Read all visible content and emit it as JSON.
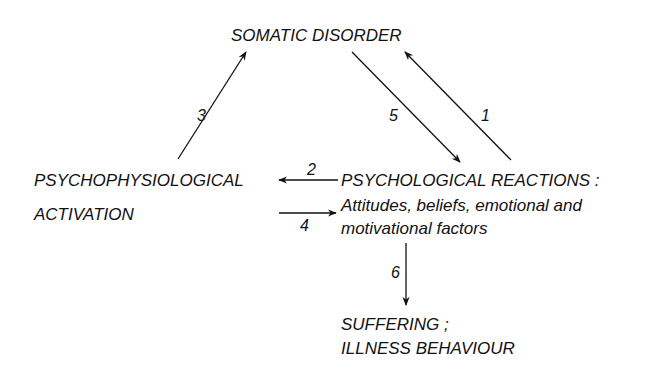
{
  "nodes": {
    "somatic": {
      "label": "SOMATIC  DISORDER"
    },
    "psychophys": {
      "line1": "PSYCHOPHYSIOLOGICAL",
      "line2": "ACTIVATION"
    },
    "psychological": {
      "line1": "PSYCHOLOGICAL  REACTIONS :",
      "line2": "Attitudes, beliefs, emotional  and",
      "line3": "motivational  factors"
    },
    "suffering": {
      "line1": "SUFFERING ;",
      "line2": "ILLNESS  BEHAVIOUR"
    }
  },
  "edges": [
    {
      "id": "1",
      "label": "1",
      "from": "psychological",
      "to": "somatic"
    },
    {
      "id": "2",
      "label": "2",
      "from": "psychological",
      "to": "psychophys"
    },
    {
      "id": "3",
      "label": "3",
      "from": "psychophys",
      "to": "somatic"
    },
    {
      "id": "4",
      "label": "4",
      "from": "psychophys",
      "to": "psychological"
    },
    {
      "id": "5",
      "label": "5",
      "from": "somatic",
      "to": "psychological"
    },
    {
      "id": "6",
      "label": "6",
      "from": "psychological",
      "to": "suffering"
    }
  ],
  "colors": {
    "ink": "#111111",
    "background": "#ffffff"
  }
}
